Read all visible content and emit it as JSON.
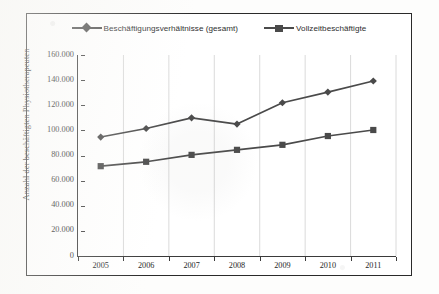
{
  "chart_data": {
    "type": "line",
    "title": "",
    "xlabel": "",
    "ylabel": "Anzahl der beschäftigten Physiotherapeuten",
    "categories": [
      "2005",
      "2006",
      "2007",
      "2008",
      "2009",
      "2010",
      "2011"
    ],
    "ylim": [
      0,
      160000
    ],
    "ytick_labels": [
      "160.000",
      "140.000",
      "120.000",
      "100.000",
      "80.000",
      "60.000",
      "40.000",
      "20.000",
      "0"
    ],
    "ytick_values": [
      160000,
      140000,
      120000,
      100000,
      80000,
      60000,
      40000,
      20000,
      0
    ],
    "grid": "vertical-only",
    "legend_position": "top-center",
    "series": [
      {
        "name": "Beschäftigungsverhältnisse (gesamt)",
        "marker": "diamond",
        "color": "#4a4a4a",
        "values": [
          94700,
          101500,
          110000,
          105000,
          122000,
          130500,
          139300
        ]
      },
      {
        "name": "Vollzeitbeschäftigte",
        "marker": "square",
        "color": "#4a4a4a",
        "values": [
          71500,
          75000,
          80500,
          84500,
          88500,
          95500,
          100300
        ]
      }
    ]
  },
  "legend": {
    "items": [
      {
        "label": "Beschäftigungsverhältnisse (gesamt)",
        "marker": "diamond"
      },
      {
        "label": "Vollzeitbeschäftigte",
        "marker": "square"
      }
    ]
  }
}
